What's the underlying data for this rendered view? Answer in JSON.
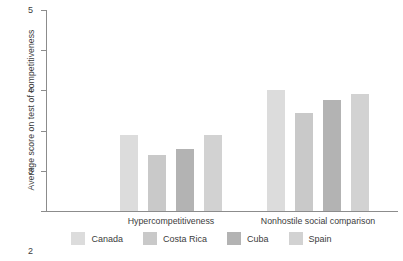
{
  "chart_data": {
    "type": "bar",
    "title": "",
    "xlabel": "",
    "ylabel": "Average score on test of competitiveness",
    "ylim": [
      0,
      5
    ],
    "yticks": [
      "0",
      "1",
      "2",
      "3",
      "4",
      "5"
    ],
    "grid": false,
    "legend_position": "bottom",
    "categories": [
      "Hypercompetitiveness",
      "Nonhostile social comparison"
    ],
    "series": [
      {
        "name": "Canada",
        "color": "#dcdcdc",
        "values": [
          1.9,
          3.0
        ]
      },
      {
        "name": "Costa Rica",
        "color": "#c9c9c9",
        "values": [
          1.4,
          2.45
        ]
      },
      {
        "name": "Cuba",
        "color": "#b3b3b3",
        "values": [
          1.55,
          2.75
        ]
      },
      {
        "name": "Spain",
        "color": "#d2d2d2",
        "values": [
          1.9,
          2.9
        ]
      }
    ]
  },
  "legend": {
    "items": [
      {
        "label": "Canada"
      },
      {
        "label": "Costa Rica"
      },
      {
        "label": "Cuba"
      },
      {
        "label": "Spain"
      }
    ]
  },
  "axis": {
    "y_title": "Average score on test of competitiveness",
    "ticks": [
      "5",
      "4",
      "3",
      "2",
      "1",
      "0"
    ]
  },
  "groups": [
    {
      "label": "Hypercompetitiveness"
    },
    {
      "label": "Nonhostile social comparison"
    }
  ]
}
